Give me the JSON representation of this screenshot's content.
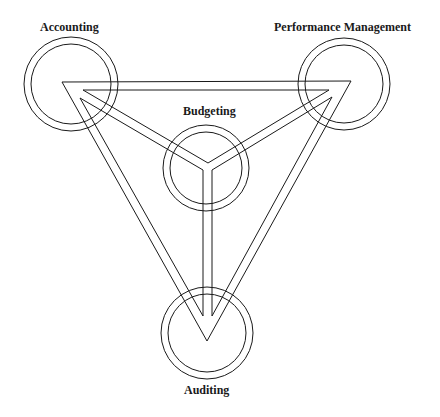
{
  "diagram": {
    "type": "triangle-relationship",
    "nodes": [
      {
        "id": "accounting",
        "label": "Accounting"
      },
      {
        "id": "performance",
        "label": "Performance Management"
      },
      {
        "id": "budgeting",
        "label": "Budgeting"
      },
      {
        "id": "auditing",
        "label": "Auditing"
      }
    ],
    "colors": {
      "line": "#1a1a1a",
      "background": "#ffffff"
    }
  }
}
